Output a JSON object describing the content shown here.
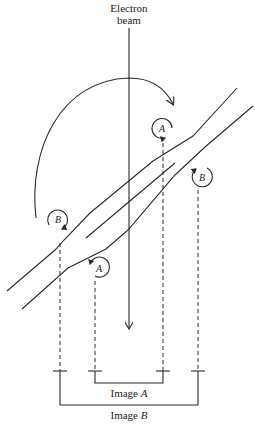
{
  "diagram": {
    "beam_label_line1": "Electron",
    "beam_label_line2": "beam",
    "circle_labels": {
      "upper_a": "A",
      "right_b": "B",
      "left_b": "B",
      "lower_a": "A"
    },
    "image_a_label_prefix": "Image ",
    "image_a_label_letter": "A",
    "image_b_label_prefix": "Image ",
    "image_b_label_letter": "B",
    "colors": {
      "ink": "#2a2a2a",
      "background": "#ffffff"
    }
  }
}
